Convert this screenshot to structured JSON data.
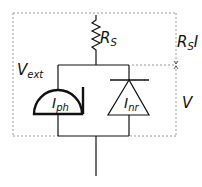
{
  "diagram": {
    "type": "equivalent-circuit",
    "labels": {
      "series_resistor": {
        "main": "R",
        "sub": "S"
      },
      "photo_current": {
        "main": "I",
        "sub": "ph"
      },
      "nonrad_current": {
        "main": "I",
        "sub": "nr"
      },
      "external_voltage": {
        "main": "V",
        "sub": "ext"
      },
      "resistor_drop": {
        "main": "R",
        "sub": "S",
        "tail": "I"
      },
      "junction_voltage": {
        "main": "V"
      }
    },
    "colors": {
      "line": "#111111",
      "dashed": "#9a9a9a",
      "background": "#ffffff"
    }
  }
}
